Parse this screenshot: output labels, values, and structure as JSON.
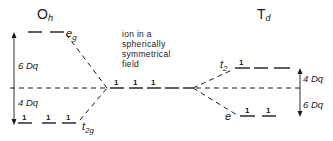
{
  "diagram": {
    "type": "crystal-field-splitting",
    "left": {
      "title": "O",
      "title_sub": "h",
      "upper_label": "e",
      "upper_label_sub": "g",
      "lower_label": "t",
      "lower_label_sub": "2g",
      "upper_gap": "6 Dq",
      "lower_gap": "4 Dq",
      "upper_orbitals": 2,
      "lower_orbitals": 3,
      "lower_electrons": [
        "1",
        "1",
        "1"
      ]
    },
    "center": {
      "lines": [
        "ion in a",
        "spherically",
        "symmetrical",
        "field"
      ],
      "orbitals": 5,
      "electrons": [
        "1",
        "1",
        "1"
      ]
    },
    "right": {
      "title": "T",
      "title_sub": "d",
      "upper_label": "t",
      "upper_label_sub": "2",
      "lower_label": "e",
      "upper_gap": "4 Dq",
      "lower_gap": "6 Dq",
      "upper_orbitals": 3,
      "lower_orbitals": 2,
      "upper_electrons": [
        "1"
      ],
      "lower_electrons": [
        "1",
        "1"
      ]
    }
  }
}
